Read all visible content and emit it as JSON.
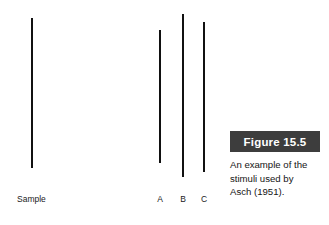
{
  "figure": {
    "canvas": {
      "width": 329,
      "height": 225,
      "background": "#ffffff"
    },
    "number_label": "Figure 15.5",
    "number_box_color": "#3d3d3d",
    "number_text_color": "#ffffff",
    "caption": "An example of the stimuli used by Asch (1951).",
    "caption_lines": [
      "An example of the",
      "stimuli used by",
      "Asch (1951)."
    ],
    "line_color": "#111111"
  },
  "stimuli": {
    "sample": {
      "label": "Sample",
      "x": 31,
      "top": 18,
      "bottom": 168,
      "length": 150
    },
    "comparison": [
      {
        "label": "A",
        "x": 159,
        "top": 30,
        "bottom": 163,
        "length": 133
      },
      {
        "label": "B",
        "x": 182,
        "top": 14,
        "bottom": 177,
        "length": 163
      },
      {
        "label": "C",
        "x": 203,
        "top": 22,
        "bottom": 172,
        "length": 150
      }
    ],
    "label_baseline_y": 194
  },
  "chart_data": {
    "type": "bar",
    "title": "Figure 15.5",
    "subtitle": "An example of the stimuli used by Asch (1951).",
    "orientation": "vertical-lines",
    "xlabel": "",
    "ylabel": "Line length (px)",
    "categories": [
      "Sample",
      "A",
      "B",
      "C"
    ],
    "values": [
      150,
      133,
      163,
      150
    ],
    "ylim": [
      0,
      170
    ],
    "grid": false,
    "legend": null,
    "annotations": [
      "Sample line matches comparison line C in length",
      "Comparison lines labelled A, B and C"
    ]
  }
}
